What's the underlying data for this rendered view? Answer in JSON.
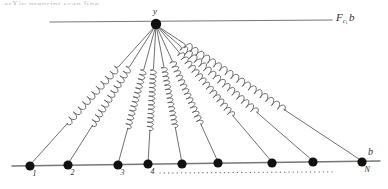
{
  "figure": {
    "title_artifact": "arXiv preprint scan line",
    "apex_label": "y",
    "force_label": {
      "base": "F",
      "sub": "c",
      "subsub": "1",
      "operand": "b"
    },
    "right_label": "b",
    "baseline_labels": [
      "1",
      "2",
      "3",
      "4",
      "",
      "",
      "",
      "",
      "N"
    ],
    "ellipsis_dots": "· · · · · · · · · · ·"
  },
  "chart_data": {
    "type": "diagram",
    "apex": {
      "label": "y",
      "x": 156,
      "y": 24,
      "radius": 5.2
    },
    "apex_rod": {
      "x1": 50,
      "y1": 22,
      "x2": 332,
      "y2": 20,
      "label": "F_{c_1} b"
    },
    "baseline_rod": {
      "x1": 12,
      "y1": 166,
      "x2": 380,
      "y2": 161,
      "label": "b"
    },
    "baseline_dotted_segment": {
      "x1": 160,
      "y": 173,
      "x2": 332
    },
    "nodes": [
      {
        "index": 1,
        "label": "1",
        "x": 30,
        "y": 166,
        "radius": 4.6
      },
      {
        "index": 2,
        "label": "2",
        "x": 68,
        "y": 165,
        "radius": 4.6
      },
      {
        "index": 3,
        "label": "3",
        "x": 118,
        "y": 165,
        "radius": 4.6
      },
      {
        "index": 4,
        "label": "4",
        "x": 148,
        "y": 164,
        "radius": 4.6
      },
      {
        "index": 5,
        "label": "",
        "x": 182,
        "y": 164,
        "radius": 4.6
      },
      {
        "index": 6,
        "label": "",
        "x": 218,
        "y": 163,
        "radius": 4.6
      },
      {
        "index": 7,
        "label": "",
        "x": 272,
        "y": 163,
        "radius": 4.6
      },
      {
        "index": 8,
        "label": "",
        "x": 313,
        "y": 162,
        "radius": 4.6
      },
      {
        "index": 9,
        "label": "N",
        "x": 362,
        "y": 162,
        "radius": 4.6
      }
    ],
    "springs": [
      {
        "for_node": 1,
        "coils": 11,
        "amplitude": 3.4,
        "t_start": 0.3,
        "t_end": 0.7
      },
      {
        "for_node": 2,
        "coils": 12,
        "amplitude": 3.4,
        "t_start": 0.3,
        "t_end": 0.72
      },
      {
        "for_node": 3,
        "coils": 13,
        "amplitude": 3.2,
        "t_start": 0.32,
        "t_end": 0.74
      },
      {
        "for_node": 4,
        "coils": 14,
        "amplitude": 3.2,
        "t_start": 0.32,
        "t_end": 0.76
      },
      {
        "for_node": 5,
        "coils": 14,
        "amplitude": 3.0,
        "t_start": 0.3,
        "t_end": 0.74
      },
      {
        "for_node": 6,
        "coils": 14,
        "amplitude": 3.2,
        "t_start": 0.26,
        "t_end": 0.72
      },
      {
        "for_node": 7,
        "coils": 15,
        "amplitude": 3.4,
        "t_start": 0.2,
        "t_end": 0.66
      },
      {
        "for_node": 8,
        "coils": 16,
        "amplitude": 3.6,
        "t_start": 0.16,
        "t_end": 0.64
      },
      {
        "for_node": 9,
        "coils": 17,
        "amplitude": 3.6,
        "t_start": 0.14,
        "t_end": 0.62
      }
    ],
    "colors": {
      "ink": "#3a3a3a",
      "node_fill": "#111111",
      "rod": "#777777",
      "spring": "#555555",
      "background": "#ffffff"
    }
  }
}
